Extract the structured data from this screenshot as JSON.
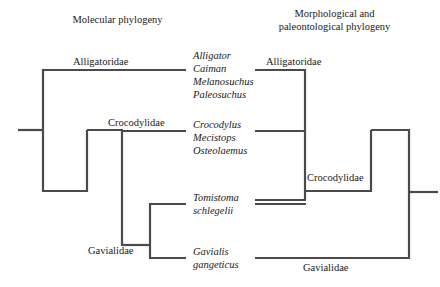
{
  "figure": {
    "background_color": "#ffffff",
    "line_color": "#4a4a4a"
  },
  "left_panel": {
    "title": "Molecular phylogeny",
    "clades": [
      {
        "label": "Alligatoridae"
      },
      {
        "label": "Crocodylidae"
      },
      {
        "label": "Gavialidae"
      }
    ]
  },
  "right_panel": {
    "title_line1": "Morphological and",
    "title_line2": "paleontological phylogeny",
    "clades": [
      {
        "label": "Alligatoridae"
      },
      {
        "label": "Crocodylidae"
      },
      {
        "label": "Gavialidae"
      }
    ]
  },
  "taxa_groups": [
    {
      "name": "alligatoridae-taxa",
      "names": [
        "Alligator",
        "Caiman",
        "Melanosuchus",
        "Paleosuchus"
      ]
    },
    {
      "name": "crocodylidae-taxa",
      "names": [
        "Crocodylus",
        "Mecistops",
        "Osteolaemus"
      ]
    },
    {
      "name": "tomistoma-taxa",
      "names": [
        "Tomistoma",
        "schlegelii"
      ]
    },
    {
      "name": "gavialis-taxa",
      "names": [
        "Gavialis",
        "gangeticus"
      ]
    }
  ]
}
